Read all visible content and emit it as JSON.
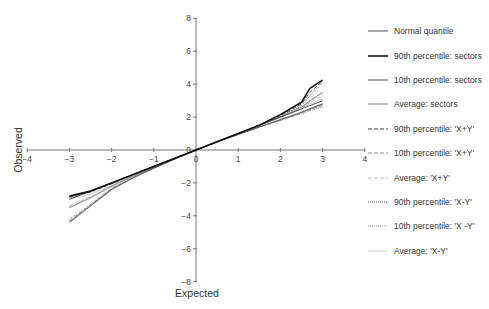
{
  "chart_data": {
    "type": "line",
    "title": "",
    "xlabel": "Expected",
    "ylabel": "Observed",
    "xlim": [
      -4,
      4
    ],
    "ylim": [
      -8,
      8
    ],
    "x_ticks": [
      -4,
      -3,
      -2,
      -1,
      0,
      1,
      2,
      3,
      4
    ],
    "y_ticks": [
      -8,
      -6,
      -4,
      -2,
      0,
      2,
      4,
      6,
      8
    ],
    "grid": false,
    "legend_position": "right",
    "x": [
      -3.0,
      -2.5,
      -2.0,
      -1.5,
      -1.0,
      -0.5,
      0.0,
      0.5,
      1.0,
      1.5,
      2.0,
      2.5,
      2.7,
      3.0
    ],
    "series": [
      {
        "name": "Normal quantile",
        "color": "#555555",
        "width": 1,
        "dash": "",
        "values": [
          -3.0,
          -2.5,
          -2.0,
          -1.5,
          -1.0,
          -0.5,
          0.0,
          0.5,
          1.0,
          1.5,
          2.0,
          2.5,
          2.7,
          3.0
        ]
      },
      {
        "name": "90th percentile: sectors",
        "color": "#111111",
        "width": 1.6,
        "dash": "",
        "values": [
          -2.8,
          -2.5,
          -2.0,
          -1.5,
          -1.0,
          -0.5,
          0.0,
          0.5,
          1.0,
          1.5,
          2.15,
          2.9,
          3.75,
          4.25
        ]
      },
      {
        "name": "10th percentile: sectors",
        "color": "#666666",
        "width": 1.2,
        "dash": "",
        "values": [
          -4.4,
          -3.4,
          -2.4,
          -1.7,
          -1.1,
          -0.55,
          0.0,
          0.5,
          0.95,
          1.4,
          1.85,
          2.3,
          2.5,
          2.8
        ]
      },
      {
        "name": "Average: sectors",
        "color": "#999999",
        "width": 1.2,
        "dash": "",
        "values": [
          -3.5,
          -2.9,
          -2.2,
          -1.6,
          -1.05,
          -0.5,
          0.0,
          0.5,
          1.0,
          1.5,
          2.0,
          2.6,
          3.0,
          3.5
        ]
      },
      {
        "name": "90th percentile: 'X+Y'",
        "color": "#444444",
        "width": 1,
        "dash": "4,2",
        "values": [
          -2.85,
          -2.55,
          -2.05,
          -1.5,
          -1.0,
          -0.5,
          0.0,
          0.5,
          1.0,
          1.5,
          2.1,
          2.8,
          3.5,
          4.2
        ]
      },
      {
        "name": "10th percentile: 'X+Y'",
        "color": "#888888",
        "width": 1,
        "dash": "4,2",
        "values": [
          -4.3,
          -3.35,
          -2.35,
          -1.7,
          -1.1,
          -0.55,
          0.0,
          0.5,
          0.95,
          1.4,
          1.8,
          2.25,
          2.45,
          2.7
        ]
      },
      {
        "name": "Average: 'X+Y'",
        "color": "#bbbbbb",
        "width": 1,
        "dash": "4,2",
        "values": [
          -3.4,
          -2.85,
          -2.2,
          -1.6,
          -1.05,
          -0.5,
          0.0,
          0.5,
          1.0,
          1.5,
          2.0,
          2.55,
          2.9,
          3.3
        ]
      },
      {
        "name": "90th percentile: 'X-Y'",
        "color": "#555555",
        "width": 1,
        "dash": "1,1",
        "values": [
          -2.9,
          -2.55,
          -2.05,
          -1.5,
          -1.0,
          -0.5,
          0.0,
          0.5,
          1.0,
          1.5,
          2.05,
          2.7,
          3.3,
          4.1
        ]
      },
      {
        "name": "10th percentile: 'X -Y'",
        "color": "#999999",
        "width": 1,
        "dash": "1,1",
        "values": [
          -4.2,
          -3.3,
          -2.3,
          -1.65,
          -1.1,
          -0.55,
          0.0,
          0.5,
          0.95,
          1.4,
          1.8,
          2.2,
          2.4,
          2.6
        ]
      },
      {
        "name": "Average: 'X-Y'",
        "color": "#cccccc",
        "width": 1,
        "dash": "",
        "values": [
          -3.0,
          -2.7,
          -2.15,
          -1.6,
          -1.05,
          -0.5,
          0.0,
          0.5,
          1.0,
          1.5,
          2.0,
          2.5,
          2.8,
          3.1
        ]
      }
    ]
  }
}
